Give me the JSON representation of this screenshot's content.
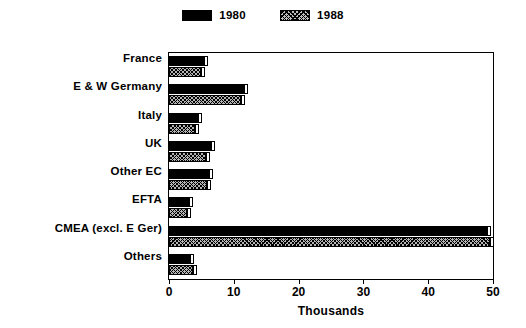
{
  "chart_data": {
    "type": "bar",
    "orientation": "horizontal",
    "title": "",
    "xlabel": "Thousands",
    "ylabel": "",
    "xlim": [
      0,
      50
    ],
    "xticks": [
      0,
      10,
      20,
      30,
      40,
      50
    ],
    "xtick_labels": [
      "0",
      "10",
      "20",
      "30",
      "40",
      "50"
    ],
    "grid": false,
    "legend_position": "top-center",
    "categories": [
      "France",
      "E & W Germany",
      "Italy",
      "UK",
      "Other EC",
      "EFTA",
      "CMEA (excl. E Ger)",
      "Others"
    ],
    "series": [
      {
        "name": "1980",
        "pattern": "solid",
        "color": "#000000",
        "values": [
          5.4,
          11.6,
          4.5,
          6.5,
          6.2,
          3.1,
          49.1,
          3.2
        ]
      },
      {
        "name": "1988",
        "pattern": "hatch",
        "color": "#b5b5b5",
        "values": [
          4.9,
          11.1,
          4.0,
          5.7,
          5.9,
          2.8,
          49.6,
          3.7
        ]
      }
    ]
  },
  "legend": {
    "entries": [
      {
        "label": "1980",
        "swatch": "solid-black-swatch"
      },
      {
        "label": "1988",
        "swatch": "hatched-swatch"
      }
    ]
  },
  "axis": {
    "x_title": "Thousands"
  }
}
